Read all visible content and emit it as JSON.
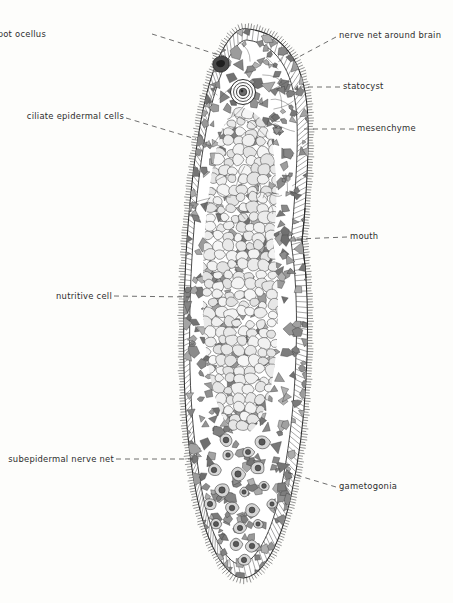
{
  "figure": {
    "type": "scientific-line-drawing",
    "background_color": "#fdfdfb",
    "ink_color": "#2b2b2b",
    "body": {
      "orientation": "vertical, anterior at top",
      "anterior_y": 25,
      "posterior_y": 578,
      "left_margin_x": 182,
      "right_margin_x": 311
    }
  },
  "labels": [
    {
      "id": "pigment-spot-ocellus",
      "text": "pigment-spot ocellus",
      "side": "left",
      "x": 46,
      "y": 30
    },
    {
      "id": "ciliate-epidermal-cells",
      "text": "ciliate epidermal cells",
      "side": "left",
      "x": 22,
      "y": 112
    },
    {
      "id": "nutritive-cell",
      "text": "nutritive cell",
      "side": "left",
      "x": 54,
      "y": 292
    },
    {
      "id": "subepidermal-nerve-net",
      "text": "subepidermal nerve net",
      "side": "left",
      "x": 14,
      "y": 455
    },
    {
      "id": "nerve-net-around-brain",
      "text": "nerve net around brain",
      "side": "right",
      "x": 339,
      "y": 31
    },
    {
      "id": "statocyst",
      "text": "statocyst",
      "side": "right",
      "x": 343,
      "y": 82
    },
    {
      "id": "mesenchyme",
      "text": "mesenchyme",
      "side": "right",
      "x": 357,
      "y": 124
    },
    {
      "id": "mouth",
      "text": "mouth",
      "side": "right",
      "x": 350,
      "y": 232
    },
    {
      "id": "gametogonia",
      "text": "gametogonia",
      "side": "right",
      "x": 339,
      "y": 482
    }
  ],
  "structures": [
    {
      "name": "cilia-fringe",
      "description": "dense radial cilia around entire body margin"
    },
    {
      "name": "epidermis-layer",
      "description": "band of columnar ciliated epidermal cells"
    },
    {
      "name": "statocyst",
      "description": "concentric rings with dark granular statolith",
      "cx": 243,
      "cy": 92,
      "r": 12
    },
    {
      "name": "pigment-spot-ocellus",
      "description": "dark pigment cup at anterior left margin"
    },
    {
      "name": "central-gut",
      "description": "mass of large rounded nutritive cells"
    },
    {
      "name": "mesenchyme",
      "description": "dark angular stellate parenchyma cells"
    },
    {
      "name": "gametogonia",
      "description": "round cells with dark nuclei in posterior region"
    },
    {
      "name": "mouth",
      "description": "ventral notch in right body margin",
      "x": 300,
      "y": 240
    }
  ]
}
